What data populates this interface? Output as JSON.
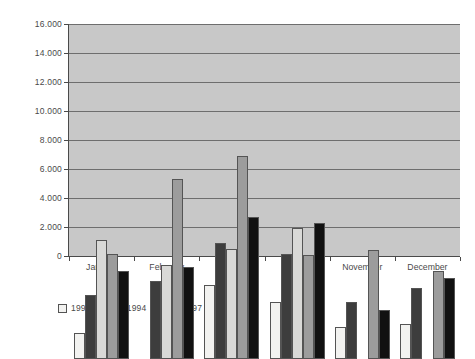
{
  "chart_data": {
    "type": "bar",
    "title": "",
    "subtitle": "",
    "xlabel": "",
    "ylabel": "",
    "categories": [
      "January",
      "February",
      "March",
      "April",
      "November",
      "December"
    ],
    "series": [
      {
        "name": "1993",
        "color": "#f2f2f0",
        "values": [
          1800,
          0,
          5100,
          3950,
          2200,
          2400
        ]
      },
      {
        "name": "1994",
        "color": "#3d3d3d",
        "values": [
          4400,
          5400,
          8000,
          7250,
          3950,
          4900
        ]
      },
      {
        "name": "1997",
        "color": "#d9d9d7",
        "values": [
          8200,
          6500,
          7600,
          9050,
          0,
          0
        ]
      },
      {
        "name": "1998",
        "color": "#9c9c9c",
        "values": [
          7250,
          12400,
          14000,
          7150,
          7500,
          6050
        ]
      },
      {
        "name": "2000",
        "color": "#111111",
        "values": [
          6050,
          6350,
          9800,
          9400,
          3400,
          5600
        ]
      }
    ],
    "ylim": [
      0,
      16000
    ],
    "ytick_values": [
      0,
      2000,
      4000,
      6000,
      8000,
      10000,
      12000,
      14000,
      16000
    ],
    "ytick_labels": [
      "0",
      "2.000",
      "4.000",
      "6.000",
      "8.000",
      "10.000",
      "12.000",
      "14.000",
      "16.000"
    ],
    "grid": true,
    "legend_position": "bottom",
    "plot_background": "#c8c8c8",
    "gridline_color": "#6e6e6e",
    "axis_color": "#4a4a4a"
  }
}
